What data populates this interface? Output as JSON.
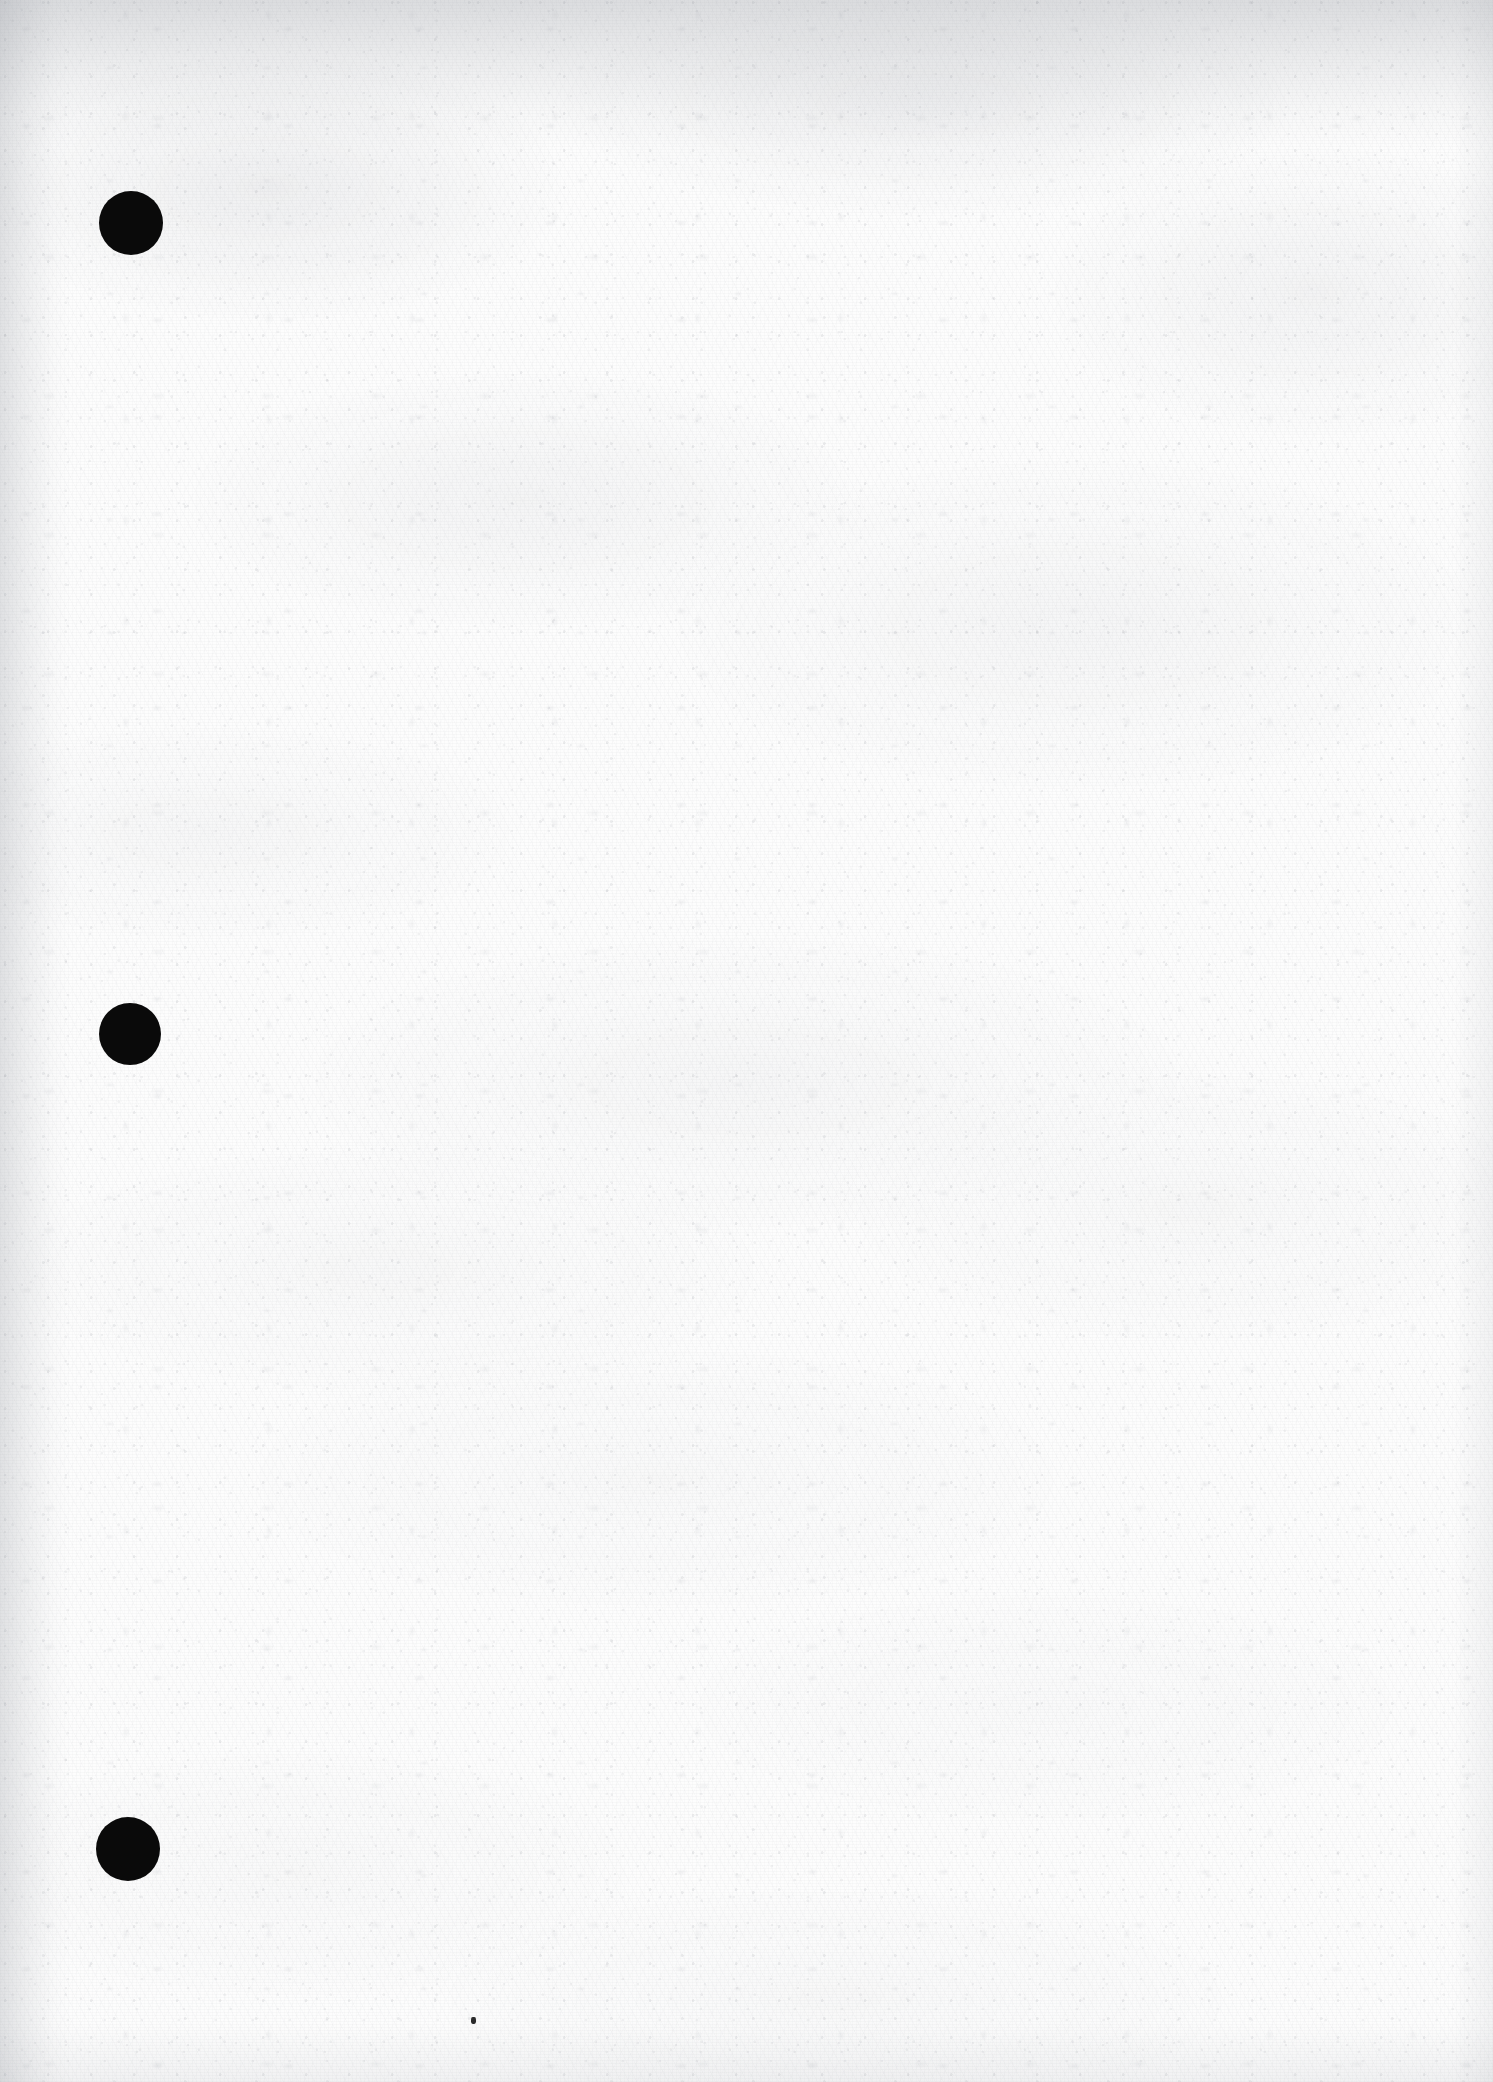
{
  "document": {
    "kind": "scanned-page",
    "title": "Blank scanned page",
    "page_width": 1493,
    "page_height": 2082,
    "paper_color": "#fdfdfd",
    "ink_color": "#0a0a0a",
    "content_text": "",
    "notes": "Blank off-white scanned sheet with three black binder hole-punch marks down the left margin and one small stray ink speck near the bottom centre."
  },
  "marks": {
    "punch_holes": [
      {
        "name": "punch-hole-top",
        "cx": 131,
        "cy": 223,
        "r": 32,
        "color": "#0a0a0a"
      },
      {
        "name": "punch-hole-middle",
        "cx": 130,
        "cy": 1034,
        "r": 31,
        "color": "#0a0a0a"
      },
      {
        "name": "punch-hole-bottom",
        "cx": 128,
        "cy": 1849,
        "r": 32,
        "color": "#0a0a0a"
      }
    ],
    "specks": [
      {
        "name": "ink-speck-bottom",
        "x": 471,
        "y": 2017,
        "w": 5,
        "h": 7,
        "color": "#2b2b2b"
      }
    ]
  },
  "texture": {
    "grain_tint": "#92969e",
    "edge_shadow_tint": "#8d9199"
  }
}
